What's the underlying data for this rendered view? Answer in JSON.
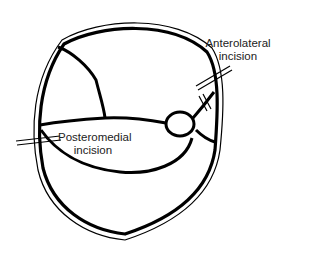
{
  "diagram": {
    "title": "",
    "labels": {
      "anterolateral": "Anterolateral\nincision",
      "posteromedial": "Posteromedial\nincision"
    },
    "colors": {
      "stroke": "#000000",
      "text": "#222222",
      "background": "#ffffff"
    }
  }
}
